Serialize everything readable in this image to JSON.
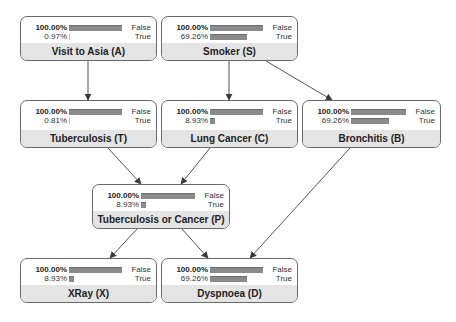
{
  "network": {
    "nodes": [
      {
        "id": "A",
        "title": "Visit to Asia (A)",
        "x": 20,
        "y": 16,
        "w": 137,
        "h": 45,
        "states": [
          {
            "label": "False",
            "pct_text": "100.00%",
            "bar": 100
          },
          {
            "label": "True",
            "pct_text": "0.97%",
            "bar": 0.97
          }
        ]
      },
      {
        "id": "S",
        "title": "Smoker (S)",
        "x": 161,
        "y": 16,
        "w": 137,
        "h": 45,
        "states": [
          {
            "label": "False",
            "pct_text": "100.00%",
            "bar": 100
          },
          {
            "label": "True",
            "pct_text": "69.26%",
            "bar": 69.26
          }
        ]
      },
      {
        "id": "T",
        "title": "Tuberculosis (T)",
        "x": 20,
        "y": 100,
        "w": 137,
        "h": 48,
        "states": [
          {
            "label": "False",
            "pct_text": "100.00%",
            "bar": 100
          },
          {
            "label": "True",
            "pct_text": "0.81%",
            "bar": 0.81
          }
        ]
      },
      {
        "id": "C",
        "title": "Lung Cancer (C)",
        "x": 161,
        "y": 100,
        "w": 137,
        "h": 48,
        "states": [
          {
            "label": "False",
            "pct_text": "100.00%",
            "bar": 100
          },
          {
            "label": "True",
            "pct_text": "8.93%",
            "bar": 8.93
          }
        ]
      },
      {
        "id": "B",
        "title": "Bronchitis (B)",
        "x": 302,
        "y": 100,
        "w": 139,
        "h": 48,
        "states": [
          {
            "label": "False",
            "pct_text": "100.00%",
            "bar": 100
          },
          {
            "label": "True",
            "pct_text": "69.26%",
            "bar": 69.26
          }
        ]
      },
      {
        "id": "P",
        "title": "Tuberculosis or Cancer (P)",
        "x": 92,
        "y": 184,
        "w": 138,
        "h": 45,
        "states": [
          {
            "label": "False",
            "pct_text": "100.00%",
            "bar": 100
          },
          {
            "label": "True",
            "pct_text": "8.93%",
            "bar": 8.93
          }
        ]
      },
      {
        "id": "X",
        "title": "XRay (X)",
        "x": 20,
        "y": 258,
        "w": 137,
        "h": 45,
        "states": [
          {
            "label": "False",
            "pct_text": "100.00%",
            "bar": 100
          },
          {
            "label": "True",
            "pct_text": "8.93%",
            "bar": 8.93
          }
        ]
      },
      {
        "id": "D",
        "title": "Dyspnoea (D)",
        "x": 161,
        "y": 258,
        "w": 137,
        "h": 45,
        "states": [
          {
            "label": "False",
            "pct_text": "100.00%",
            "bar": 100
          },
          {
            "label": "True",
            "pct_text": "69.26%",
            "bar": 69.26
          }
        ]
      }
    ],
    "edges": [
      {
        "from": "A",
        "to": "T",
        "x1": 88,
        "y1": 61,
        "x2": 88,
        "y2": 100
      },
      {
        "from": "S",
        "to": "C",
        "x1": 229,
        "y1": 61,
        "x2": 229,
        "y2": 100
      },
      {
        "from": "S",
        "to": "B",
        "x1": 266,
        "y1": 61,
        "x2": 332,
        "y2": 100
      },
      {
        "from": "T",
        "to": "P",
        "x1": 108,
        "y1": 148,
        "x2": 141,
        "y2": 184
      },
      {
        "from": "C",
        "to": "P",
        "x1": 210,
        "y1": 148,
        "x2": 181,
        "y2": 184
      },
      {
        "from": "B",
        "to": "D",
        "x1": 350,
        "y1": 148,
        "x2": 250,
        "y2": 258
      },
      {
        "from": "P",
        "to": "X",
        "x1": 137,
        "y1": 229,
        "x2": 110,
        "y2": 258
      },
      {
        "from": "P",
        "to": "D",
        "x1": 182,
        "y1": 229,
        "x2": 208,
        "y2": 258
      }
    ],
    "colors": {
      "bar": "#8a8a8a",
      "title_bg": "#e4e4e4",
      "border": "#6a6a6a",
      "edge": "#555555"
    }
  }
}
